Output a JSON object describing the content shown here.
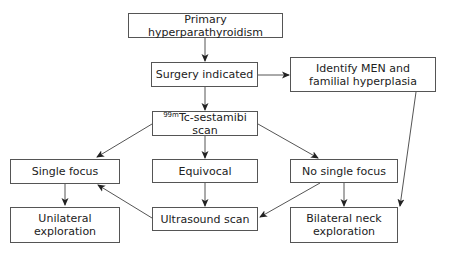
{
  "diagram": {
    "nodes": {
      "primary": {
        "label": "Primary hyperparathyroidism"
      },
      "surgery": {
        "label": "Surgery indicated"
      },
      "identify": {
        "line1": "Identify MEN and",
        "line2": "familial hyperplasia"
      },
      "scan": {
        "sup": "99m",
        "label": "Tc-sestamibi scan"
      },
      "single": {
        "label": "Single focus"
      },
      "equivocal": {
        "label": "Equivocal"
      },
      "nosingle": {
        "label": "No single focus"
      },
      "unilateral": {
        "line1": "Unilateral",
        "line2": "exploration"
      },
      "ultrasound": {
        "label": "Ultrasound scan"
      },
      "bilateral": {
        "line1": "Bilateral neck",
        "line2": "exploration"
      }
    },
    "edges": [
      {
        "from": "primary",
        "to": "surgery"
      },
      {
        "from": "surgery",
        "to": "identify"
      },
      {
        "from": "surgery",
        "to": "scan"
      },
      {
        "from": "scan",
        "to": "single"
      },
      {
        "from": "scan",
        "to": "equivocal"
      },
      {
        "from": "scan",
        "to": "nosingle"
      },
      {
        "from": "single",
        "to": "unilateral"
      },
      {
        "from": "equivocal",
        "to": "ultrasound"
      },
      {
        "from": "ultrasound",
        "to": "single"
      },
      {
        "from": "nosingle",
        "to": "ultrasound"
      },
      {
        "from": "nosingle",
        "to": "bilateral"
      },
      {
        "from": "identify",
        "to": "bilateral"
      }
    ],
    "colors": {
      "line": "#555555",
      "text": "#222222",
      "background": "#ffffff"
    }
  }
}
